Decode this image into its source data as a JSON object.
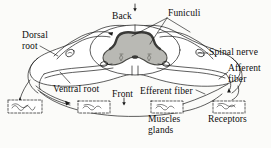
{
  "figure": {
    "background_color": "#fbfbf9",
    "line_color": "#1a1a1a",
    "gray_matter_fill": "#b9b9b4",
    "gray_matter_edge": "#4a4a46",
    "central_canal_fill": "#3a3a38",
    "white_matter_fill": "#ffffff"
  },
  "labels": {
    "back": "Back",
    "funiculi": "Funiculi",
    "dorsal_root": "Dorsal root",
    "dorsal_root_line1": "Dorsal",
    "dorsal_root_line2": "root",
    "spinal_nerve": "Spinal nerve",
    "afferent_fiber": "Afferent fiber",
    "afferent_fiber_line1": "Afferent",
    "afferent_fiber_line2": "fiber",
    "ventral_root": "Ventral root",
    "front": "Front",
    "efferent_fiber": "Efferent fiber",
    "muscles_glands": "Muscles glands",
    "muscles_line1": "Muscles",
    "muscles_line2": "glands",
    "receptors": "Receptors"
  },
  "markers": {
    "back_arrow": "down-arrow",
    "front_arrow": "down-arrow",
    "receptor_arrow": "up-arrow",
    "muscle_arrow": "left-down-arrow",
    "far_left_arrow": "up-arrow"
  },
  "organ_boxes": [
    {
      "name": "muscle-box-far-left",
      "x": 8,
      "y": 100,
      "w": 34,
      "h": 13
    },
    {
      "name": "muscle-box-left",
      "x": 78,
      "y": 101,
      "w": 32,
      "h": 12
    },
    {
      "name": "muscle-box-center",
      "x": 151,
      "y": 101,
      "w": 32,
      "h": 12
    },
    {
      "name": "receptor-box-right",
      "x": 213,
      "y": 101,
      "w": 32,
      "h": 12
    }
  ]
}
